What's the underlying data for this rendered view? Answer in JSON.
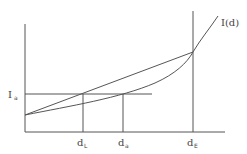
{
  "diagram": {
    "title": "",
    "curve_label": "I(d)",
    "y_label_main": "I",
    "y_label_sub": "a",
    "x_labels": [
      {
        "main": "d",
        "sub": "L"
      },
      {
        "main": "d",
        "sub": "a"
      },
      {
        "main": "d",
        "sub": "E"
      }
    ],
    "stroke_color": "#555555",
    "background": "#ffffff"
  },
  "elements": {
    "y_axis": {
      "x": 25,
      "y1": 24,
      "y2": 132
    },
    "x_axis": {
      "y": 132,
      "x1": 25,
      "x2": 225
    },
    "ia_line": {
      "y": 94,
      "x1": 25,
      "x2": 152
    },
    "dL_line": {
      "x": 83,
      "y1": 94,
      "y2": 132
    },
    "da_line": {
      "x": 123,
      "y1": 94,
      "y2": 132
    },
    "dE_line": {
      "x": 193,
      "y1": 11,
      "y2": 132
    },
    "chord": {
      "x1": 25,
      "y1": 115,
      "x2": 193,
      "y2": 52
    },
    "curve_start": {
      "x": 25,
      "y": 115
    },
    "curve_intersect": {
      "x": 193,
      "y": 52
    },
    "curve_end": {
      "x": 218,
      "y": 16
    }
  }
}
